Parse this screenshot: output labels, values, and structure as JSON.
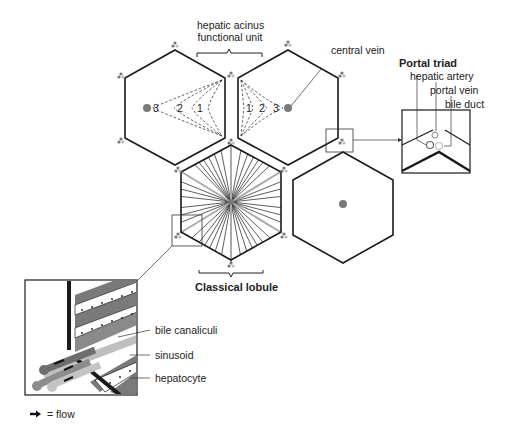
{
  "labels": {
    "acinus_line1": "hepatic acinus",
    "acinus_line2": "functional unit",
    "central_vein": "central vein",
    "portal_triad_title": "Portal triad",
    "hepatic_artery": "hepatic artery",
    "portal_vein": "portal vein",
    "bile_duct": "bile duct",
    "classical_lobule": "Classical lobule",
    "bile_canaliculi": "bile canaliculi",
    "sinusoid": "sinusoid",
    "hepatocyte": "hepatocyte",
    "legend_flow": "= flow"
  },
  "zones": {
    "left": [
      "3",
      "2",
      "1"
    ],
    "right": [
      "1",
      "2",
      "3"
    ]
  },
  "colors": {
    "outline": "#1a1a1a",
    "vein_dot": "#7a7a7a",
    "light_gray": "#c4c4c4",
    "mid_gray": "#8c8c8c",
    "dark_gray": "#6e6e6e"
  }
}
